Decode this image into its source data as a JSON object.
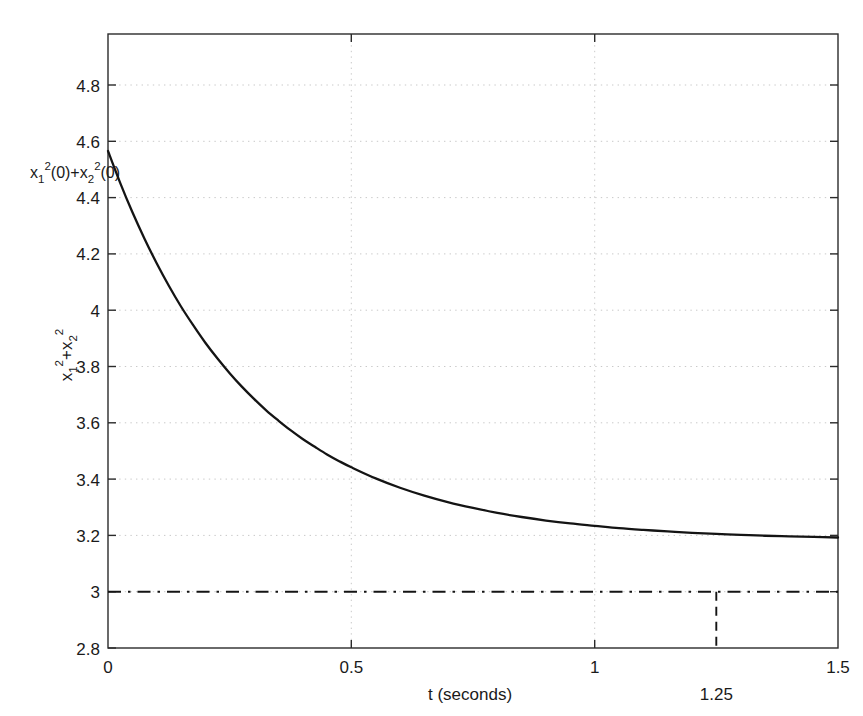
{
  "figure": {
    "background_color": "#ffffff",
    "curve_color": "#141414",
    "grid_color": "#c9c9c9",
    "axis_color": "#2b2b2b"
  },
  "labels": {
    "xlabel": "t (seconds)",
    "ylabel_base": "x",
    "ylabel_sub1": "1",
    "ylabel_sup1": "2",
    "ylabel_plus": "+x",
    "ylabel_sub2": "2",
    "ylabel_sup2": "2",
    "initial_annotation": "x₁²(0)+x₂²(0)",
    "marker_annotation": "1.25"
  },
  "axes": {
    "x_ticks": [
      "0",
      "0.5",
      "1",
      "1.5"
    ],
    "y_ticks": [
      "2.8",
      "3",
      "3.2",
      "3.4",
      "3.6",
      "3.8",
      "4",
      "4.2",
      "4.4",
      "4.6",
      "4.8"
    ]
  },
  "chart_data": {
    "type": "line",
    "title": "",
    "xlabel": "t (seconds)",
    "ylabel": "x_1^2 + x_2^2",
    "xlim": [
      0,
      1.5
    ],
    "ylim": [
      2.8,
      4.9
    ],
    "x_ticks": [
      0,
      0.5,
      1,
      1.5
    ],
    "y_ticks": [
      2.8,
      3.0,
      3.2,
      3.4,
      3.6,
      3.8,
      4.0,
      4.2,
      4.4,
      4.6,
      4.8
    ],
    "grid": true,
    "legend": false,
    "series": [
      {
        "name": "x_1^2 + x_2^2",
        "style": "solid",
        "color": "#141414",
        "x": [
          0.0,
          0.025,
          0.05,
          0.075,
          0.1,
          0.125,
          0.15,
          0.175,
          0.2,
          0.225,
          0.25,
          0.275,
          0.3,
          0.325,
          0.35,
          0.375,
          0.4,
          0.425,
          0.45,
          0.475,
          0.5,
          0.55,
          0.6,
          0.65,
          0.7,
          0.75,
          0.8,
          0.85,
          0.9,
          0.95,
          1.0,
          1.05,
          1.1,
          1.15,
          1.2,
          1.25,
          1.3,
          1.35,
          1.4,
          1.45,
          1.5
        ],
        "y": [
          4.5,
          4.391,
          4.291,
          4.2,
          4.116,
          4.039,
          3.968,
          3.904,
          3.844,
          3.79,
          3.74,
          3.694,
          3.652,
          3.613,
          3.578,
          3.545,
          3.515,
          3.488,
          3.462,
          3.439,
          3.418,
          3.38,
          3.348,
          3.321,
          3.298,
          3.279,
          3.262,
          3.248,
          3.236,
          3.226,
          3.218,
          3.21,
          3.204,
          3.199,
          3.194,
          3.19,
          3.187,
          3.184,
          3.182,
          3.18,
          3.178
        ]
      },
      {
        "name": "asymptote",
        "style": "dash-dot",
        "color": "#141414",
        "constant_y": 3.0,
        "x": [
          0,
          1.5
        ],
        "y": [
          3.0,
          3.0
        ]
      },
      {
        "name": "t = 1.25 marker",
        "style": "dashed-vertical",
        "color": "#141414",
        "x_value": 1.25,
        "y_range": [
          2.8,
          3.0
        ]
      }
    ],
    "annotations": [
      {
        "text": "x_1^2(0)+x_2^2(0)",
        "x": 0.0,
        "y": 4.55,
        "position": "left-of-axis"
      },
      {
        "text": "1.25",
        "x": 1.25,
        "y": 2.73,
        "position": "below-axis"
      }
    ]
  }
}
